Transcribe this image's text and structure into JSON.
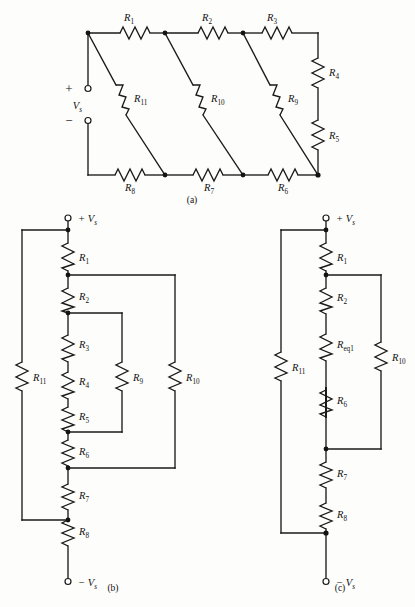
{
  "figure": {
    "background_color": "#fdfdfb",
    "line_color": "#1a1a1a"
  },
  "captions": {
    "a": "(a)",
    "b": "(b)",
    "c": "(c)"
  },
  "source_labels": {
    "vs": "V",
    "vs_sub": "s",
    "plus": "+",
    "minus": "−",
    "plus_vs": "+ V",
    "minus_vs": "− V"
  },
  "circuit_a": {
    "name": "ladder-network-original",
    "resistor_prefix": "R",
    "resistors": [
      {
        "id": "a-R1",
        "label": "R",
        "sub": "1",
        "orientation": "horizontal",
        "position": "top-rail-left"
      },
      {
        "id": "a-R2",
        "label": "R",
        "sub": "2",
        "orientation": "horizontal",
        "position": "top-rail-middle"
      },
      {
        "id": "a-R3",
        "label": "R",
        "sub": "3",
        "orientation": "horizontal",
        "position": "top-rail-right"
      },
      {
        "id": "a-R4",
        "label": "R",
        "sub": "4",
        "orientation": "vertical",
        "position": "right-branch-upper"
      },
      {
        "id": "a-R5",
        "label": "R",
        "sub": "5",
        "orientation": "vertical",
        "position": "right-branch-lower"
      },
      {
        "id": "a-R6",
        "label": "R",
        "sub": "6",
        "orientation": "horizontal",
        "position": "bottom-rail-right"
      },
      {
        "id": "a-R7",
        "label": "R",
        "sub": "7",
        "orientation": "horizontal",
        "position": "bottom-rail-middle"
      },
      {
        "id": "a-R8",
        "label": "R",
        "sub": "8",
        "orientation": "horizontal",
        "position": "bottom-rail-left"
      },
      {
        "id": "a-R9",
        "label": "R",
        "sub": "9",
        "orientation": "diagonal",
        "position": "rung-right"
      },
      {
        "id": "a-R10",
        "label": "R",
        "sub": "10",
        "orientation": "diagonal",
        "position": "rung-middle"
      },
      {
        "id": "a-R11",
        "label": "R",
        "sub": "11",
        "orientation": "diagonal",
        "position": "rung-left"
      }
    ],
    "source": {
      "label": "V",
      "sub": "s",
      "plus": "+",
      "minus": "−"
    }
  },
  "circuit_b": {
    "name": "ladder-network-redrawn",
    "resistors": [
      {
        "id": "b-R1",
        "label": "R",
        "sub": "1",
        "branch": "main-series"
      },
      {
        "id": "b-R2",
        "label": "R",
        "sub": "2",
        "branch": "main-series"
      },
      {
        "id": "b-R3",
        "label": "R",
        "sub": "3",
        "branch": "main-series"
      },
      {
        "id": "b-R4",
        "label": "R",
        "sub": "4",
        "branch": "main-series"
      },
      {
        "id": "b-R5",
        "label": "R",
        "sub": "5",
        "branch": "main-series"
      },
      {
        "id": "b-R6",
        "label": "R",
        "sub": "6",
        "branch": "main-series"
      },
      {
        "id": "b-R7",
        "label": "R",
        "sub": "7",
        "branch": "main-series"
      },
      {
        "id": "b-R8",
        "label": "R",
        "sub": "8",
        "branch": "main-series"
      },
      {
        "id": "b-R9",
        "label": "R",
        "sub": "9",
        "branch": "inner-parallel"
      },
      {
        "id": "b-R10",
        "label": "R",
        "sub": "10",
        "branch": "outer-parallel"
      },
      {
        "id": "b-R11",
        "label": "R",
        "sub": "11",
        "branch": "leftmost-parallel"
      }
    ],
    "terminals": {
      "top": "+ V",
      "top_sub": "s",
      "bottom": "− V",
      "bottom_sub": "s"
    }
  },
  "circuit_c": {
    "name": "ladder-network-simplified",
    "resistors": [
      {
        "id": "c-R1",
        "label": "R",
        "sub": "1",
        "branch": "main-series"
      },
      {
        "id": "c-R2",
        "label": "R",
        "sub": "2",
        "branch": "main-series"
      },
      {
        "id": "c-Req1",
        "label": "R",
        "sub": "eq1",
        "branch": "main-series"
      },
      {
        "id": "c-R6",
        "label": "R",
        "sub": "6",
        "branch": "main-series"
      },
      {
        "id": "c-R7",
        "label": "R",
        "sub": "7",
        "branch": "main-series"
      },
      {
        "id": "c-R8",
        "label": "R",
        "sub": "8",
        "branch": "main-series"
      },
      {
        "id": "c-R10",
        "label": "R",
        "sub": "10",
        "branch": "right-parallel"
      },
      {
        "id": "c-R11",
        "label": "R",
        "sub": "11",
        "branch": "leftmost-parallel"
      }
    ],
    "terminals": {
      "top": "+ V",
      "top_sub": "s",
      "bottom": "− V",
      "bottom_sub": "s"
    }
  }
}
